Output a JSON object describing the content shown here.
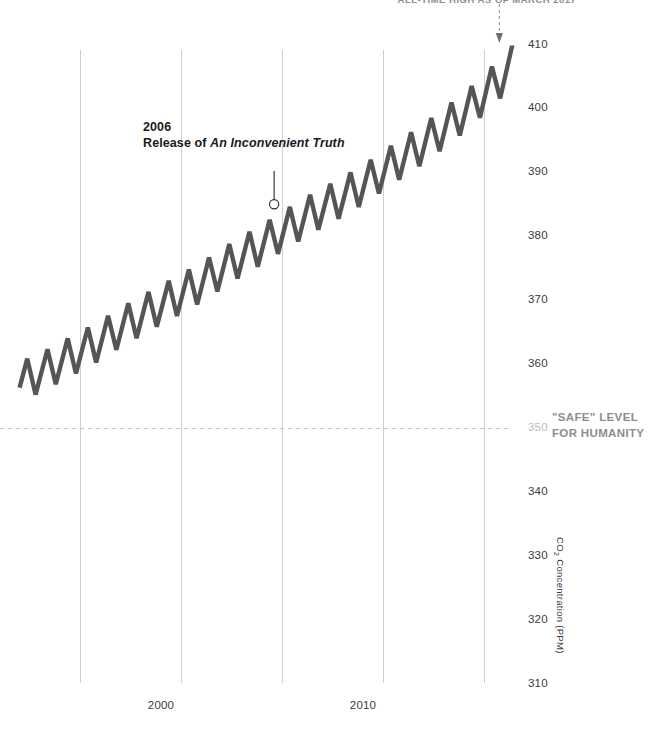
{
  "chart_data": {
    "type": "line",
    "title": "",
    "xlabel": "",
    "ylabel": "CO2 Concentration (PPM)",
    "ylabel_display": "CO₂ Concentration (PPM)",
    "grid": true,
    "legend": "none",
    "xlim": [
      1993.0,
      2017.4
    ],
    "ylim": [
      310,
      414
    ],
    "xticks": [
      2000,
      2010
    ],
    "xtick_labels": [
      "2000",
      "2010"
    ],
    "yticks": [
      410,
      400,
      390,
      380,
      370,
      360,
      350,
      340,
      330,
      320,
      310
    ],
    "ytick_labels": [
      "410",
      "400",
      "390",
      "380",
      "370",
      "360",
      "350",
      "340",
      "330",
      "320",
      "310"
    ],
    "gridline_years": [
      1996,
      2001,
      2006,
      2011,
      2016
    ],
    "series": [
      {
        "name": "Monthly mean CO2 concentration (Mauna Loa)",
        "color": "#555555",
        "seasonal_amplitude_ppm": 6.2,
        "x": [
          1993.0,
          1993.5,
          1994.0,
          1994.5,
          1995.0,
          1995.5,
          1996.0,
          1996.5,
          1997.0,
          1997.5,
          1998.0,
          1998.5,
          1999.0,
          1999.5,
          2000.0,
          2000.5,
          2001.0,
          2001.5,
          2002.0,
          2002.5,
          2003.0,
          2003.5,
          2004.0,
          2004.5,
          2005.0,
          2005.5,
          2006.0,
          2006.5,
          2007.0,
          2007.5,
          2008.0,
          2008.5,
          2009.0,
          2009.5,
          2010.0,
          2010.5,
          2011.0,
          2011.5,
          2012.0,
          2012.5,
          2013.0,
          2013.5,
          2014.0,
          2014.5,
          2015.0,
          2015.5,
          2016.0,
          2016.5,
          2017.0,
          2017.25
        ],
        "trend_ppm": [
          357.2,
          357.9,
          358.6,
          359.4,
          360.3,
          361.1,
          362.0,
          362.8,
          363.7,
          364.7,
          365.8,
          366.6,
          367.5,
          368.4,
          369.3,
          370.1,
          371.0,
          371.9,
          372.8,
          373.8,
          374.9,
          375.9,
          376.9,
          377.8,
          378.7,
          379.7,
          380.8,
          381.7,
          382.7,
          383.6,
          384.5,
          385.3,
          386.2,
          387.1,
          388.1,
          389.1,
          390.3,
          391.3,
          392.4,
          393.4,
          394.5,
          395.7,
          396.9,
          398.1,
          399.4,
          400.7,
          402.3,
          403.8,
          405.3,
          406.2
        ],
        "annual_min_ppm": 354.1,
        "annual_max_ppm": 409.0
      }
    ],
    "reference_line": {
      "name": "safe-level",
      "value_ppm": 350,
      "style": "dashed",
      "color": "#c2c2c2",
      "label_line1": "\"SAFE\" LEVEL",
      "label_line2": "FOR HUMANITY"
    },
    "annotations": [
      {
        "name": "inconvenient-truth-callout",
        "year": "2006",
        "text_prefix": "Release of ",
        "text_italic": "An Inconvenient Truth",
        "marker_x_year": 2005.6,
        "marker_y_ppm": 385.0,
        "marker_shape": "circle"
      },
      {
        "name": "all-time-high-callout",
        "text": "ALL-TIME HIGH AS OF MARCH 2017",
        "arrow_x_year": 2016.75,
        "arrow_target_ppm": 409.0
      }
    ]
  }
}
